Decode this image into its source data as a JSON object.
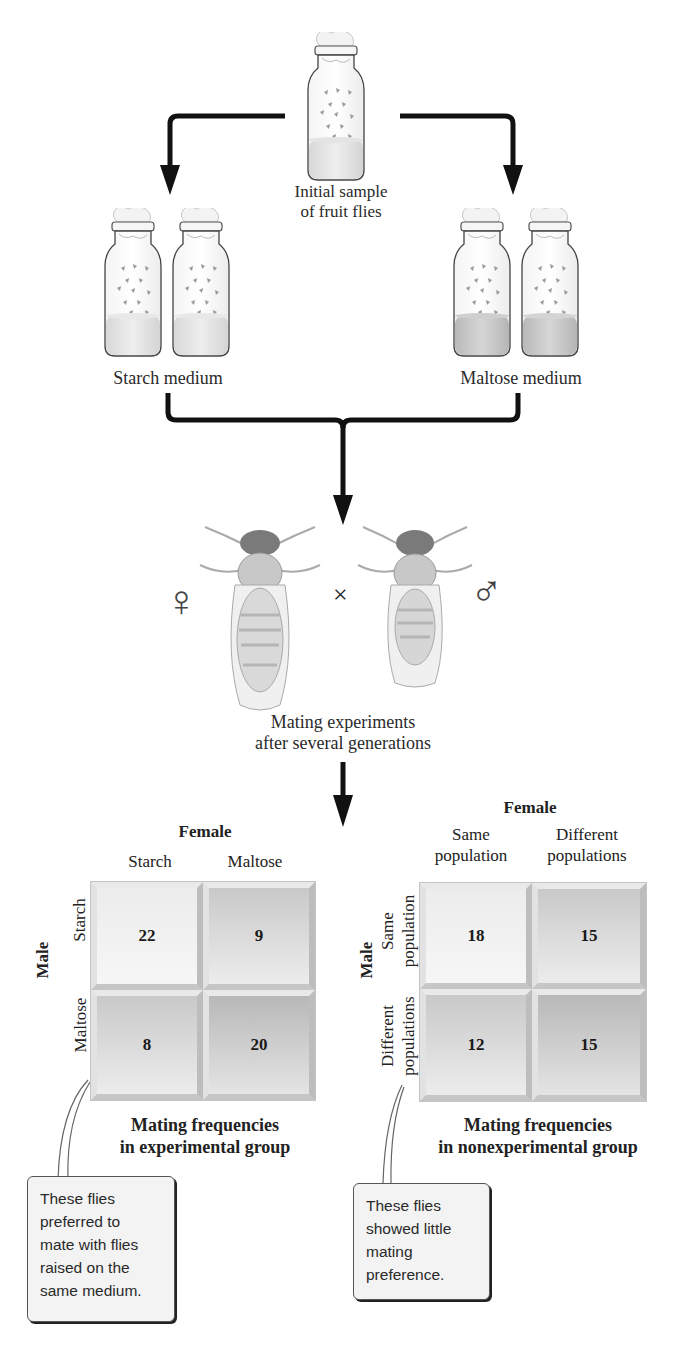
{
  "initial": {
    "label_lines": [
      "Initial sample",
      "of fruit flies"
    ],
    "icon": "bottle-with-flies-icon"
  },
  "groups": [
    {
      "label": "Starch medium",
      "bottles": 2,
      "icon": "bottle-with-flies-icon",
      "medium_color": "#e2e2e2"
    },
    {
      "label": "Maltose medium",
      "bottles": 2,
      "icon": "bottle-with-flies-icon",
      "medium_color": "#c9c9c9"
    }
  ],
  "mating": {
    "female_symbol": "♀",
    "cross_symbol": "×",
    "male_symbol": "♂",
    "label_lines": [
      "Mating experiments",
      "after several generations"
    ]
  },
  "experimental": {
    "col_axis": "Female",
    "row_axis": "Male",
    "columns": [
      "Starch",
      "Maltose"
    ],
    "rows": [
      "Starch",
      "Maltose"
    ],
    "values": [
      [
        22,
        9
      ],
      [
        8,
        20
      ]
    ],
    "caption_lines": [
      "Mating frequencies",
      "in experimental group"
    ],
    "callout_lines": [
      "These flies",
      "preferred to",
      "mate with flies",
      "raised on the",
      "same medium."
    ]
  },
  "nonexperimental": {
    "col_axis": "Female",
    "row_axis": "Male",
    "columns": [
      [
        "Same",
        "population"
      ],
      [
        "Different",
        "populations"
      ]
    ],
    "rows": [
      [
        "Same",
        "population"
      ],
      [
        "Different",
        "populations"
      ]
    ],
    "values": [
      [
        18,
        15
      ],
      [
        12,
        15
      ]
    ],
    "caption_lines": [
      "Mating frequencies",
      "in nonexperimental group"
    ],
    "callout_lines": [
      "These flies",
      "showed little",
      "mating",
      "preference."
    ]
  },
  "colors": {
    "arrow": "#111111",
    "text": "#2a2a2a",
    "matrix_frame": "#d6d6d6"
  }
}
